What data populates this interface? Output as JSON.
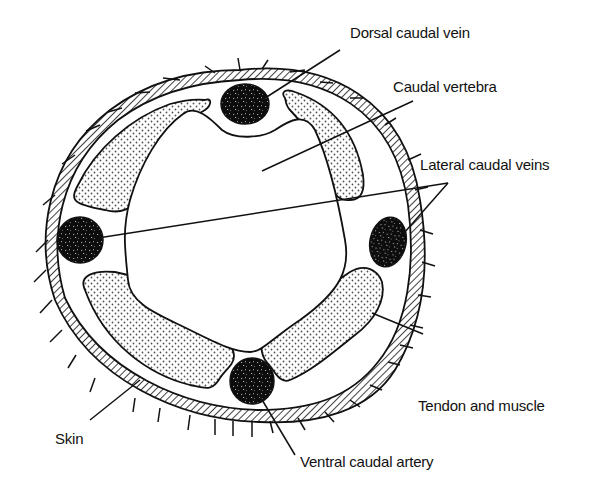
{
  "diagram": {
    "colors": {
      "ink": "#111111",
      "background": "#ffffff",
      "stipple": "#555555"
    },
    "labels": [
      {
        "id": "dorsal_caudal_vein",
        "text": "Dorsal caudal vein",
        "x": 352,
        "y": 22
      },
      {
        "id": "caudal_vertebra",
        "text": "Caudal vertebra",
        "x": 393,
        "y": 77
      },
      {
        "id": "lateral_caudal_veins",
        "text": "Lateral caudal veins",
        "x": 421,
        "y": 156
      },
      {
        "id": "tendon_and_muscle",
        "text": "Tendon and muscle",
        "x": 418,
        "y": 396
      },
      {
        "id": "skin",
        "text": "Skin",
        "x": 55,
        "y": 500
      },
      {
        "id": "ventral_caudal_artery",
        "text": "Ventral caudal artery",
        "x": 302,
        "y": 524
      }
    ],
    "structures": [
      "skin",
      "dorsal-caudal-vein",
      "lateral-caudal-vein-left",
      "lateral-caudal-vein-right",
      "ventral-caudal-artery",
      "caudal-vertebra",
      "tendon-and-muscle-upper-left",
      "tendon-and-muscle-upper-right",
      "tendon-and-muscle-lower-left",
      "tendon-and-muscle-lower-right"
    ]
  }
}
